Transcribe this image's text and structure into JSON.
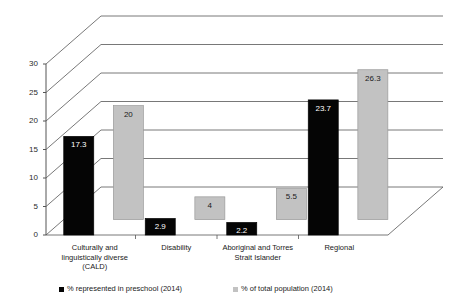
{
  "chart_data": {
    "type": "bar",
    "title": "",
    "subtitle": "",
    "xlabel": "",
    "ylabel": "",
    "ylim": [
      0,
      30
    ],
    "yticks": [
      0,
      5,
      10,
      15,
      20,
      25,
      30
    ],
    "ytick_labels": [
      "0",
      "5",
      "10",
      "15",
      "20",
      "25",
      "30"
    ],
    "grid": true,
    "grid_orientation": "horizontal",
    "legend_position": "bottom",
    "projection": "3d-perspective",
    "categories": [
      "Culturally and linguistically diverse (CALD)",
      "Disability",
      "Aboriginal and Torres Strait Islander",
      "Regional"
    ],
    "category_lines": [
      [
        "Culturally and",
        "linguistically diverse",
        "(CALD)"
      ],
      [
        "Disability"
      ],
      [
        "Aboriginal and Torres",
        "Strait Islander"
      ],
      [
        "Regional"
      ]
    ],
    "series": [
      {
        "name": "% represented in preschool (2014)",
        "color": "#050505",
        "label_color": "#ffffff",
        "values": [
          17.3,
          2.9,
          2.2,
          23.7
        ],
        "value_labels": [
          "17.3",
          "2.9",
          "2.2",
          "23.7"
        ]
      },
      {
        "name": "% of total population (2014)",
        "color": "#c2c2c2",
        "label_color": "#1a1a1a",
        "values": [
          20,
          4,
          5.5,
          26.3
        ],
        "value_labels": [
          "20",
          "4",
          "5.5",
          "26.3"
        ]
      }
    ]
  },
  "legend": {
    "items": [
      {
        "label": "% represented in preschool (2014)",
        "color": "#050505"
      },
      {
        "label": "% of total population (2014)",
        "color": "#c2c2c2"
      }
    ]
  },
  "colors": {
    "series_dark": "#050505",
    "series_light": "#c2c2c2",
    "axis": "#555555",
    "gridline": "#555555",
    "background": "#ffffff",
    "bar_outline": "#9a9a9a"
  }
}
